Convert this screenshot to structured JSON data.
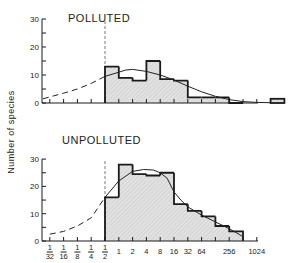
{
  "chart_data": [
    {
      "type": "bar",
      "title": "POLLUTED",
      "ylabel": "Number of species",
      "xlabel": "",
      "ylim": [
        0,
        30
      ],
      "yticks": [
        0,
        10,
        20,
        30
      ],
      "x_scale": "log2",
      "bin_edges_log2": [
        -1,
        0,
        1,
        2,
        3,
        4,
        5,
        6,
        7,
        8,
        9
      ],
      "values": [
        13,
        9,
        8,
        15,
        8.5,
        8,
        2,
        2,
        2,
        0
      ],
      "extra_bins": [
        {
          "log2_start": 11,
          "log2_end": 12,
          "value": 1.5
        }
      ],
      "fitted_curve_log2": [
        [
          -5.5,
          1.5
        ],
        [
          -4,
          3.5
        ],
        [
          -3,
          5
        ],
        [
          -2,
          7
        ],
        [
          -1,
          9.5
        ],
        [
          0,
          11
        ],
        [
          0.5,
          11.8
        ],
        [
          1,
          12
        ],
        [
          2,
          11.3
        ],
        [
          3,
          10
        ],
        [
          4,
          8.2
        ],
        [
          5,
          6
        ],
        [
          6,
          4
        ],
        [
          7,
          2.4
        ],
        [
          8,
          1.2
        ],
        [
          9,
          0.5
        ],
        [
          10,
          0.2
        ],
        [
          11,
          0.1
        ]
      ],
      "curve_dashed_below_log2": -1
    },
    {
      "type": "bar",
      "title": "UNPOLLUTED",
      "ylabel": "Number of species",
      "xlabel": "",
      "ylim": [
        0,
        30
      ],
      "yticks": [
        0,
        10,
        20,
        30
      ],
      "x_scale": "log2",
      "bin_edges_log2": [
        -1,
        0,
        1,
        2,
        3,
        4,
        5,
        6,
        7,
        8,
        9
      ],
      "values": [
        16,
        28,
        24.5,
        24,
        25,
        13.5,
        11,
        9,
        5.5,
        3.5
      ],
      "extra_bins": [],
      "fitted_curve_log2": [
        [
          -5,
          2.5
        ],
        [
          -4,
          3.5
        ],
        [
          -3,
          5.5
        ],
        [
          -2,
          8.5
        ],
        [
          -1,
          16
        ],
        [
          0,
          22
        ],
        [
          1,
          25.5
        ],
        [
          1.8,
          26.2
        ],
        [
          2.5,
          26
        ],
        [
          3,
          25
        ],
        [
          3.5,
          23
        ],
        [
          4,
          18
        ],
        [
          4.5,
          15
        ],
        [
          5,
          12.5
        ],
        [
          6,
          9.5
        ],
        [
          7,
          7
        ],
        [
          8,
          4.5
        ],
        [
          8.7,
          2.5
        ],
        [
          9,
          1.5
        ]
      ],
      "curve_dashed_below_log2": -1,
      "xtick_labels": [
        {
          "log2": -5,
          "label": "1/32"
        },
        {
          "log2": -4,
          "label": "1/16"
        },
        {
          "log2": -3,
          "label": "1/8"
        },
        {
          "log2": -2,
          "label": "1/4"
        },
        {
          "log2": -1,
          "label": "1/2"
        },
        {
          "log2": 0,
          "label": "1"
        },
        {
          "log2": 1,
          "label": "2"
        },
        {
          "log2": 2,
          "label": "4"
        },
        {
          "log2": 3,
          "label": "8"
        },
        {
          "log2": 4,
          "label": "16"
        },
        {
          "log2": 5,
          "label": "32"
        },
        {
          "log2": 6,
          "label": "64"
        },
        {
          "log2": 8,
          "label": "256"
        },
        {
          "log2": 10,
          "label": "1024"
        }
      ]
    }
  ],
  "labels": {
    "ylabel": "Number of species",
    "polluted_title": "POLLUTED",
    "unpolluted_title": "UNPOLLUTED"
  },
  "colors": {
    "fill": "#d9d9d9",
    "line": "#1a1a1a"
  }
}
